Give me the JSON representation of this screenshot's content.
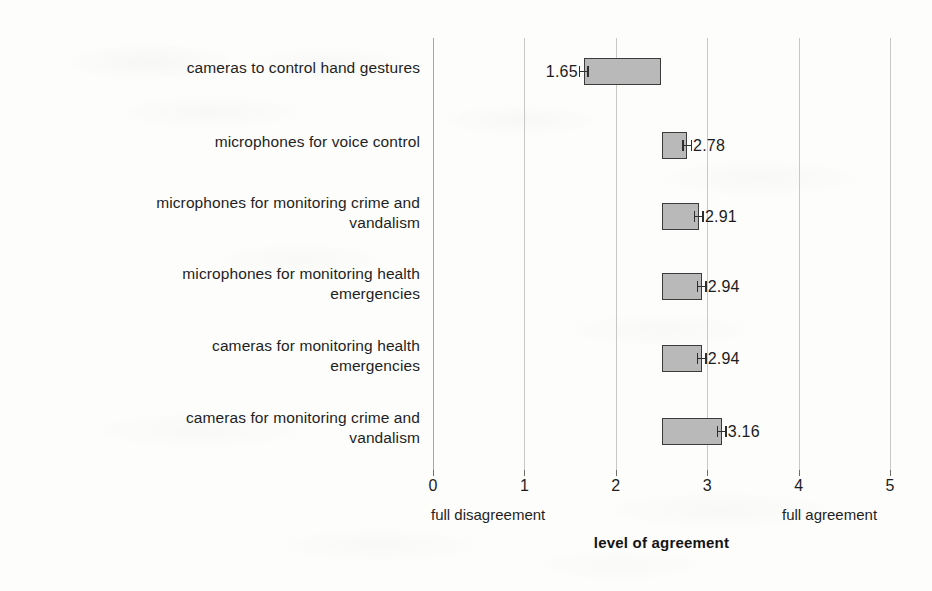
{
  "chart_data": {
    "type": "bar",
    "orientation": "horizontal",
    "baseline": 2.5,
    "title": "",
    "xlabel": "level of agreement",
    "ylabel": "",
    "xlim": [
      0,
      5
    ],
    "xticks": [
      "0",
      "1",
      "2",
      "3",
      "4",
      "5"
    ],
    "grid": true,
    "legend": null,
    "scale_anchor_low": "full disagreement",
    "scale_anchor_high": "full agreement",
    "categories": [
      "cameras to control hand gestures",
      "microphones for voice control",
      "microphones for monitoring crime and vandalism",
      "microphones for monitoring health emergencies",
      "cameras for monitoring health emergencies",
      "cameras for monitoring crime and vandalism"
    ],
    "values": [
      1.65,
      2.78,
      2.91,
      2.94,
      2.94,
      3.16
    ],
    "value_labels": [
      "1.65",
      "2.78",
      "2.91",
      "2.94",
      "2.94",
      "3.16"
    ],
    "error_bars": true
  },
  "rows": [
    {
      "label_line1": "cameras to control hand gestures",
      "label_line2": "",
      "value": 1.65,
      "value_label": "1.65"
    },
    {
      "label_line1": "microphones for voice control",
      "label_line2": "",
      "value": 2.78,
      "value_label": "2.78"
    },
    {
      "label_line1": "microphones for monitoring crime and",
      "label_line2": "vandalism",
      "value": 2.91,
      "value_label": "2.91"
    },
    {
      "label_line1": "microphones for monitoring health",
      "label_line2": "emergencies",
      "value": 2.94,
      "value_label": "2.94"
    },
    {
      "label_line1": "cameras for monitoring health",
      "label_line2": "emergencies",
      "value": 2.94,
      "value_label": "2.94"
    },
    {
      "label_line1": "cameras for monitoring crime and",
      "label_line2": "vandalism",
      "value": 3.16,
      "value_label": "3.16"
    }
  ],
  "axis": {
    "ticks": [
      "0",
      "1",
      "2",
      "3",
      "4",
      "5"
    ],
    "anchor_low": "full disagreement",
    "anchor_high": "full agreement",
    "title": "level of agreement"
  },
  "colors": {
    "bar_fill": "#b9b9b9",
    "bar_border": "#3b3b3b",
    "gridline": "#c9c9c4",
    "text": "#1c1c1c",
    "background": "#fdfdfc"
  }
}
